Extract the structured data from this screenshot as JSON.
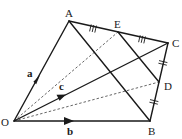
{
  "diagram": {
    "type": "vector geometry",
    "points": {
      "O": {
        "label": "O",
        "x": 14,
        "y": 121
      },
      "A": {
        "label": "A",
        "x": 69,
        "y": 21
      },
      "B": {
        "label": "B",
        "x": 150,
        "y": 121
      },
      "C": {
        "label": "C",
        "x": 168,
        "y": 43
      },
      "D": {
        "label": "D",
        "x": 159,
        "y": 82
      },
      "E": {
        "label": "E",
        "x": 118,
        "y": 32
      }
    },
    "vectors": {
      "a": {
        "label": "a",
        "from": "O",
        "to": "A"
      },
      "b": {
        "label": "b",
        "from": "O",
        "to": "B"
      },
      "c": {
        "label": "c",
        "from": "O",
        "to": "C"
      }
    },
    "solid_segments": [
      "OA",
      "OB",
      "OC",
      "AC",
      "CB",
      "AB",
      "ED"
    ],
    "dashed_segments": [
      "OE",
      "OD"
    ],
    "equal_marks": {
      "triple": [
        "AE",
        "EC"
      ],
      "double": [
        "CD",
        "DB"
      ]
    },
    "colors": {
      "line": "#1a1a1a",
      "dashed": "#555555",
      "background": "#ffffff"
    }
  }
}
